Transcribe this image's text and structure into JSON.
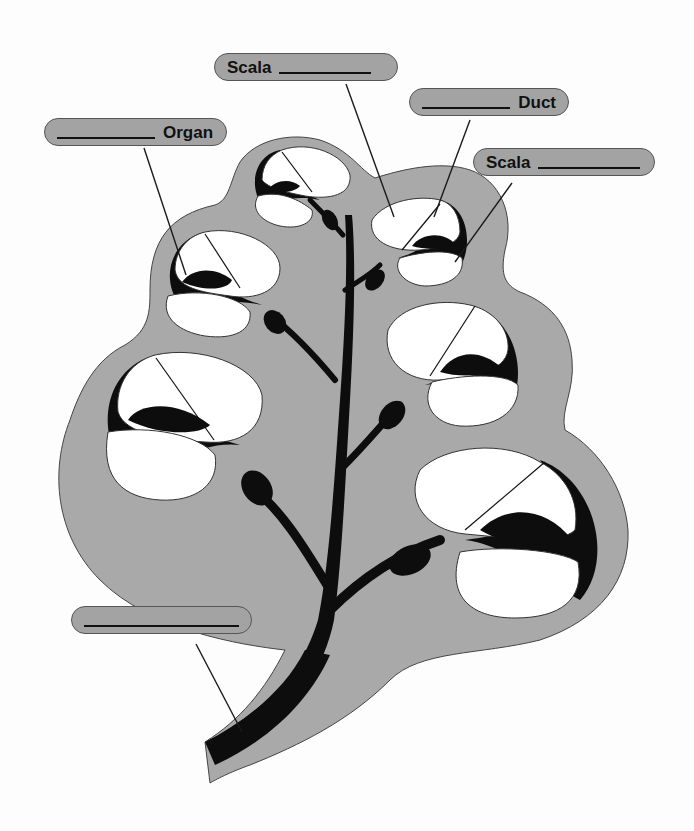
{
  "colors": {
    "background": "#fdfdfd",
    "bone_gray": "#a9a9a9",
    "pill_gray": "#a3a3a3",
    "tissue_black": "#0d0d0d",
    "chamber_white": "#ffffff",
    "outline": "#333333",
    "leader_line": "#1a1a1a"
  },
  "labels": [
    {
      "id": "scala-top",
      "prefix": "Scala",
      "suffix": "",
      "blank_width": 92,
      "box": {
        "x": 214,
        "y": 53,
        "w": 184,
        "h": 28
      }
    },
    {
      "id": "duct",
      "prefix": "",
      "suffix": "Duct",
      "blank_width": 110,
      "box": {
        "x": 409,
        "y": 88,
        "w": 160,
        "h": 28
      }
    },
    {
      "id": "scala-right",
      "prefix": "Scala",
      "suffix": "",
      "blank_width": 102,
      "box": {
        "x": 473,
        "y": 148,
        "w": 182,
        "h": 28
      }
    },
    {
      "id": "organ",
      "prefix": "",
      "suffix": "Organ",
      "blank_width": 98,
      "box": {
        "x": 44,
        "y": 118,
        "w": 183,
        "h": 28
      }
    },
    {
      "id": "nerve",
      "prefix": "",
      "suffix": "",
      "blank_width": 160,
      "box": {
        "x": 71,
        "y": 606,
        "w": 181,
        "h": 28
      }
    }
  ],
  "leader_lines": [
    {
      "label": "scala-top",
      "x1": 346,
      "y1": 84,
      "x2": 394,
      "y2": 217
    },
    {
      "label": "duct",
      "x1": 470,
      "y1": 120,
      "x2": 434,
      "y2": 217
    },
    {
      "label": "scala-right",
      "x1": 512,
      "y1": 183,
      "x2": 455,
      "y2": 262
    },
    {
      "label": "organ",
      "x1": 144,
      "y1": 148,
      "x2": 186,
      "y2": 275
    },
    {
      "label": "nerve",
      "x1": 196,
      "y1": 644,
      "x2": 242,
      "y2": 732
    }
  ],
  "diagram": {
    "turns": 7
  }
}
